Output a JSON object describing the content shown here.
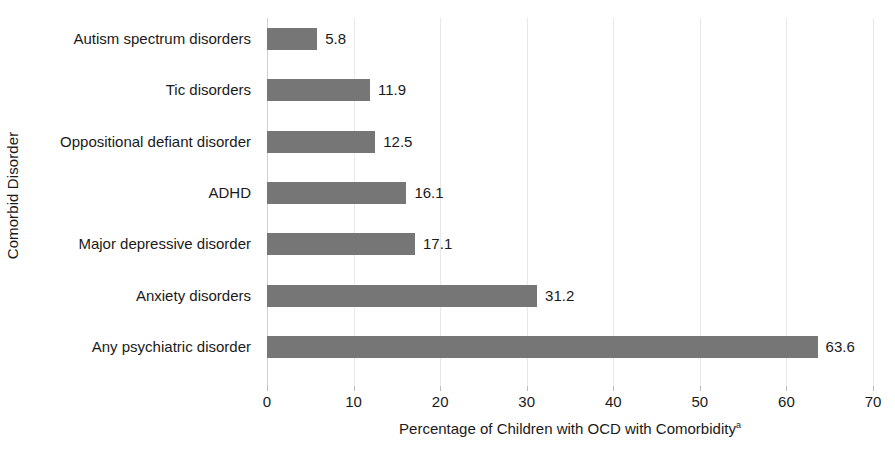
{
  "chart_data": {
    "type": "bar",
    "orientation": "horizontal",
    "title": "",
    "xlabel": "Percentage of Children with OCD with Comorbidity",
    "xlabel_superscript": "a",
    "ylabel": "Comorbid Disorder",
    "categories": [
      "Autism spectrum disorders",
      "Tic disorders",
      "Oppositional defiant disorder",
      "ADHD",
      "Major depressive disorder",
      "Anxiety disorders",
      "Any psychiatric disorder"
    ],
    "values": [
      5.8,
      11.9,
      12.5,
      16.1,
      17.1,
      31.2,
      63.6
    ],
    "data_labels": [
      "5.8",
      "11.9",
      "12.5",
      "16.1",
      "17.1",
      "31.2",
      "63.6"
    ],
    "xlim": [
      0,
      70
    ],
    "xticks": [
      0,
      10,
      20,
      30,
      40,
      50,
      60,
      70
    ],
    "xtick_labels": [
      "0",
      "10",
      "20",
      "30",
      "40",
      "50",
      "60",
      "70"
    ],
    "grid": "vertical",
    "legend": "none",
    "bar_color": "#767676",
    "gridline_color": "#e8e8e8",
    "text_color": "#1a1a1a",
    "background_color": "#ffffff"
  }
}
